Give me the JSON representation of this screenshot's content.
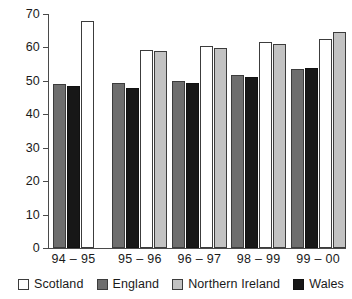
{
  "chart_data": {
    "type": "bar",
    "title": "",
    "subtitle": "",
    "xlabel": "",
    "ylabel": "",
    "ylim": [
      0,
      70
    ],
    "yticks": [
      0,
      10,
      20,
      30,
      40,
      50,
      60,
      70
    ],
    "ytick_labels": [
      "0",
      "10",
      "20",
      "30",
      "40",
      "50",
      "60",
      "70"
    ],
    "grid": false,
    "legend_position": "bottom",
    "categories": [
      "94 – 95",
      "95 – 96",
      "96 – 97",
      "98 – 99",
      "99 – 00"
    ],
    "series": [
      {
        "name": "Scotland",
        "key": "scotland",
        "color": "#ffffff",
        "values": [
          68.0,
          59.3,
          60.3,
          61.5,
          62.5
        ]
      },
      {
        "name": "England",
        "key": "england",
        "color": "#6e6e6e",
        "values": [
          49.1,
          49.5,
          49.9,
          51.7,
          53.7
        ]
      },
      {
        "name": "Northern Ireland",
        "key": "nireland",
        "color": "#c2c2c2",
        "values": [
          null,
          58.8,
          59.7,
          61.1,
          64.5
        ]
      },
      {
        "name": "Wales",
        "key": "wales",
        "color": "#171717",
        "values": [
          48.6,
          48.0,
          49.3,
          51.2,
          54.0
        ]
      }
    ],
    "bar_order": [
      "england",
      "wales",
      "scotland",
      "nireland"
    ]
  },
  "legend": {
    "items": [
      {
        "label": "Scotland",
        "key": "scotland"
      },
      {
        "label": "England",
        "key": "england"
      },
      {
        "label": "Northern Ireland",
        "key": "nireland"
      },
      {
        "label": "Wales",
        "key": "wales"
      }
    ]
  }
}
